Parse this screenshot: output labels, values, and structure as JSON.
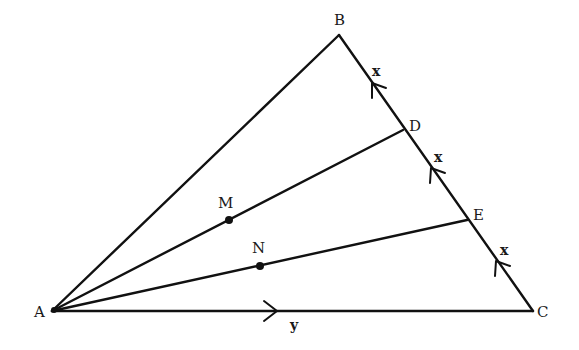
{
  "diagram": {
    "type": "geometry-triangle",
    "colors": {
      "stroke": "#111111",
      "background": "#ffffff",
      "text": "#1a1a1a"
    },
    "vertices": {
      "A": {
        "label": "A",
        "x": 52,
        "y": 311,
        "lx": 34,
        "ly": 317
      },
      "B": {
        "label": "B",
        "x": 339,
        "y": 35,
        "lx": 334,
        "ly": 25
      },
      "C": {
        "label": "C",
        "x": 533,
        "y": 311,
        "lx": 537,
        "ly": 317
      },
      "D": {
        "label": "D",
        "x": 403,
        "y": 130,
        "lx": 409,
        "ly": 131
      },
      "E": {
        "label": "E",
        "x": 467,
        "y": 220,
        "lx": 473,
        "ly": 220
      }
    },
    "points": {
      "M": {
        "label": "M",
        "x": 229,
        "y": 220,
        "lx": 218,
        "ly": 208
      },
      "N": {
        "label": "N",
        "x": 260,
        "y": 266,
        "lx": 252,
        "ly": 253
      }
    },
    "segments": [
      {
        "name": "AB",
        "from": "A",
        "to": "B"
      },
      {
        "name": "BC",
        "from": "B",
        "to": "C"
      },
      {
        "name": "AC",
        "from": "A",
        "to": "C"
      },
      {
        "name": "AD",
        "from": "A",
        "to": "D"
      },
      {
        "name": "AE",
        "from": "A",
        "to": "E"
      }
    ],
    "vector_labels": [
      {
        "name": "x-BD",
        "text": "x",
        "x": 372,
        "y": 76
      },
      {
        "name": "x-DE",
        "text": "x",
        "x": 434,
        "y": 162
      },
      {
        "name": "x-EC",
        "text": "x",
        "x": 500,
        "y": 255
      },
      {
        "name": "y-AC",
        "text": "y",
        "x": 290,
        "y": 330
      }
    ],
    "arrow_markers": [
      {
        "name": "arrow-BD",
        "tip_x": 372,
        "tip_y": 83,
        "direction": "toward-B"
      },
      {
        "name": "arrow-DE",
        "tip_x": 431,
        "tip_y": 168,
        "direction": "toward-D"
      },
      {
        "name": "arrow-EC",
        "tip_x": 496,
        "tip_y": 261,
        "direction": "toward-E"
      },
      {
        "name": "arrow-AC",
        "tip_x": 276,
        "tip_y": 311,
        "direction": "toward-C"
      }
    ]
  }
}
